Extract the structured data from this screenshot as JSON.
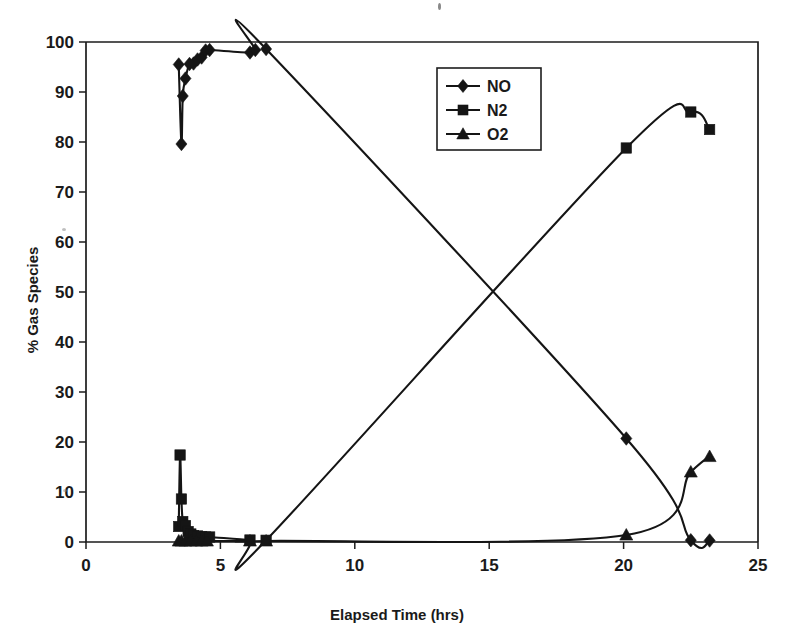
{
  "figure": {
    "background_color": "#ffffff",
    "ink_color": "#151515"
  },
  "chart_data": {
    "type": "line",
    "title": "",
    "xlabel": "Elapsed Time (hrs)",
    "ylabel": "% Gas Species",
    "xlim": [
      0,
      25
    ],
    "ylim": [
      0,
      100
    ],
    "xticks": [
      "0",
      "5",
      "10",
      "15",
      "20",
      "25"
    ],
    "xtick_values": [
      0,
      5,
      10,
      15,
      20,
      25
    ],
    "yticks": [
      "0",
      "10",
      "20",
      "30",
      "40",
      "50",
      "60",
      "70",
      "80",
      "90",
      "100"
    ],
    "ytick_values": [
      0,
      10,
      20,
      30,
      40,
      50,
      60,
      70,
      80,
      90,
      100
    ],
    "grid": false,
    "legend_position": "upper center-right",
    "series": [
      {
        "name": "NO",
        "marker": "diamond",
        "x": [
          3.45,
          3.55,
          3.6,
          3.7,
          3.85,
          4.0,
          4.15,
          4.3,
          4.45,
          4.6,
          6.1,
          6.3,
          6.7,
          20.1,
          22.5,
          23.2
        ],
        "y": [
          95.5,
          79.6,
          89.2,
          92.7,
          95.6,
          95.7,
          96.5,
          96.9,
          98.3,
          98.4,
          97.9,
          98.4,
          98.6,
          20.7,
          0.35,
          0.3
        ]
      },
      {
        "name": "N2",
        "marker": "square",
        "x": [
          3.45,
          3.5,
          3.55,
          3.6,
          3.7,
          3.8,
          3.9,
          4.0,
          4.15,
          4.3,
          4.45,
          4.6,
          6.1,
          6.7,
          20.1,
          22.5,
          23.2
        ],
        "y": [
          3.1,
          17.4,
          8.6,
          4.1,
          3.3,
          2.1,
          1.6,
          1.3,
          1.2,
          1.1,
          1.0,
          1.0,
          0.4,
          0.35,
          78.8,
          86.0,
          82.5
        ]
      },
      {
        "name": "O2",
        "marker": "triangle",
        "x": [
          3.45,
          3.55,
          3.7,
          3.9,
          4.1,
          4.3,
          4.5,
          6.1,
          6.7,
          20.1,
          22.5,
          23.2
        ],
        "y": [
          0.2,
          0.2,
          0.2,
          0.2,
          0.2,
          0.2,
          0.2,
          0.2,
          0.2,
          1.4,
          14.0,
          17.1
        ]
      }
    ]
  },
  "legend": {
    "entries": [
      {
        "label": "NO",
        "marker": "diamond"
      },
      {
        "label": "N2",
        "marker": "square"
      },
      {
        "label": "O2",
        "marker": "triangle"
      }
    ]
  }
}
